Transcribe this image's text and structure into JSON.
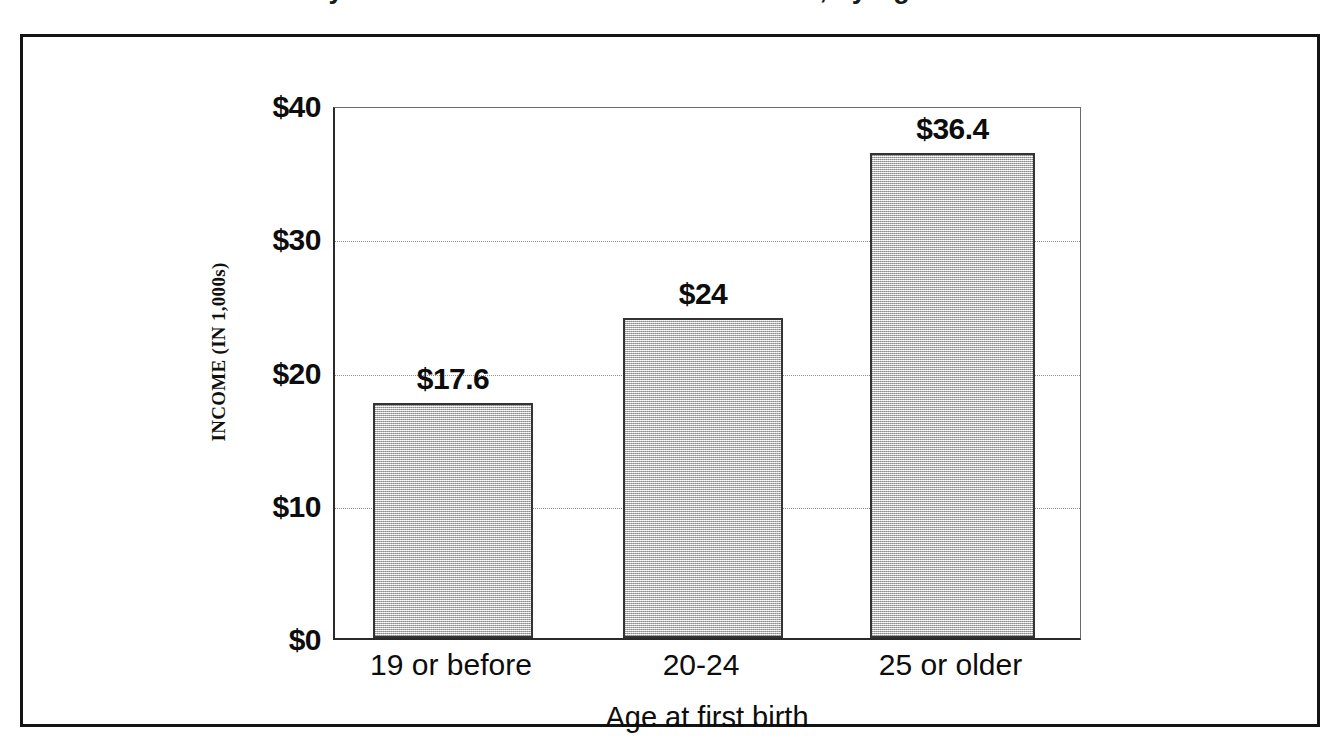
{
  "figure": {
    "cut_off_title": "Median Family Income of Women Who Are Mothers, by Age at First Birth"
  },
  "chart_data": {
    "type": "bar",
    "title": "",
    "xlabel": "Age at first birth",
    "ylabel": "INCOME (IN 1,000s)",
    "categories": [
      "19 or before",
      "20-24",
      "25 or older"
    ],
    "values": [
      17.6,
      24,
      36.4
    ],
    "value_labels": [
      "$17.6",
      "$24",
      "$36.4"
    ],
    "ylim": [
      0,
      40
    ],
    "yticks": [
      0,
      10,
      20,
      30,
      40
    ],
    "ytick_labels": [
      "$0",
      "$10",
      "$20",
      "$30",
      "$40"
    ],
    "grid": true,
    "grid_style": "dotted-horizontal",
    "legend": "none",
    "bar_fill_color": "#d4d4d4",
    "bar_border_color": "#333333",
    "axis_color": "#2a2a2a",
    "gridline_color": "#8d8d8d",
    "text_color": "#0d0d0d"
  }
}
